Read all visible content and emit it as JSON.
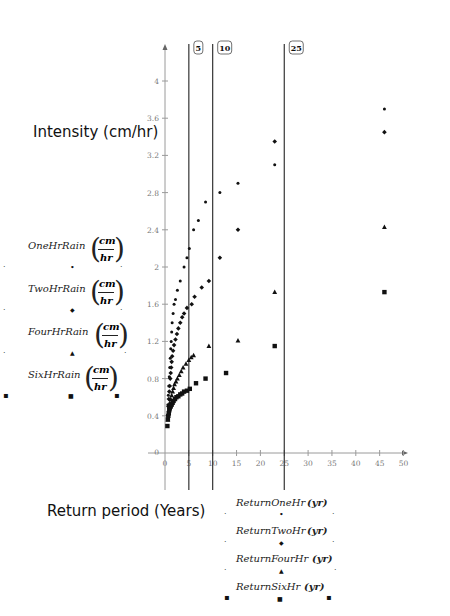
{
  "chart_data": {
    "type": "scatter",
    "title": "",
    "ylabel": "Intensity (cm/hr)",
    "xlabel": "Return period  (Years)",
    "xlim": [
      0,
      50
    ],
    "ylim": [
      0,
      4.2
    ],
    "x_ticks": [
      0,
      5,
      10,
      15,
      20,
      25,
      30,
      35,
      40,
      45,
      50
    ],
    "y_ticks": [
      0,
      0.4,
      0.8,
      1.2,
      1.6,
      2,
      2.4,
      2.8,
      3.2,
      3.6,
      4
    ],
    "y_tick_labels": [
      "0",
      "0.4",
      "0.8",
      "1.2",
      "1.6",
      "2",
      "2.4",
      "2.8",
      "3.2",
      "3.6",
      "4"
    ],
    "x_tick_labels": [
      "0",
      "5",
      "10",
      "15",
      "20",
      "25",
      "30",
      "35",
      "40",
      "45",
      "50"
    ],
    "grid": false,
    "vertical_markers": [
      {
        "x": 5,
        "label": "5"
      },
      {
        "x": 10,
        "label": "10"
      },
      {
        "x": 25,
        "label": "25"
      }
    ],
    "series": [
      {
        "name": "OneHrRain (cm/hr) vs ReturnOneHr (yr)",
        "y_name": "OneHrRain",
        "y_unit_num": "cm",
        "y_unit_den": "hr",
        "x_name": "ReturnOneHr",
        "x_unit": "yr",
        "marker": "dot",
        "points": [
          [
            0.6,
            0.52
          ],
          [
            0.7,
            0.62
          ],
          [
            0.8,
            0.72
          ],
          [
            0.9,
            0.82
          ],
          [
            1.0,
            0.92
          ],
          [
            1.1,
            1.02
          ],
          [
            1.2,
            1.12
          ],
          [
            1.3,
            1.2
          ],
          [
            1.4,
            1.3
          ],
          [
            1.5,
            1.4
          ],
          [
            1.7,
            1.5
          ],
          [
            1.9,
            1.6
          ],
          [
            2.2,
            1.65
          ],
          [
            2.6,
            1.75
          ],
          [
            3.2,
            1.85
          ],
          [
            4.0,
            2.0
          ],
          [
            4.6,
            2.1
          ],
          [
            5.1,
            2.2
          ],
          [
            6.0,
            2.4
          ],
          [
            7.0,
            2.5
          ],
          [
            8.5,
            2.7
          ],
          [
            11.5,
            2.8
          ],
          [
            15.3,
            2.9
          ],
          [
            23.0,
            3.1
          ],
          [
            46.0,
            3.7
          ]
        ]
      },
      {
        "name": "TwoHrRain (cm/hr) vs ReturnTwoHr (yr)",
        "y_name": "TwoHrRain",
        "y_unit_num": "cm",
        "y_unit_den": "hr",
        "x_name": "ReturnTwoHr",
        "x_unit": "yr",
        "marker": "diamond",
        "points": [
          [
            0.6,
            0.4
          ],
          [
            0.7,
            0.5
          ],
          [
            0.8,
            0.58
          ],
          [
            0.9,
            0.66
          ],
          [
            1.0,
            0.72
          ],
          [
            1.1,
            0.8
          ],
          [
            1.2,
            0.86
          ],
          [
            1.3,
            0.92
          ],
          [
            1.4,
            0.98
          ],
          [
            1.5,
            1.04
          ],
          [
            1.7,
            1.1
          ],
          [
            1.9,
            1.16
          ],
          [
            2.2,
            1.22
          ],
          [
            2.5,
            1.28
          ],
          [
            2.8,
            1.34
          ],
          [
            3.2,
            1.4
          ],
          [
            3.6,
            1.46
          ],
          [
            4.0,
            1.5
          ],
          [
            4.6,
            1.56
          ],
          [
            5.6,
            1.6
          ],
          [
            6.2,
            1.68
          ],
          [
            7.7,
            1.78
          ],
          [
            9.2,
            1.85
          ],
          [
            11.5,
            2.1
          ],
          [
            15.3,
            2.4
          ],
          [
            23.0,
            3.35
          ],
          [
            46.0,
            3.45
          ]
        ]
      },
      {
        "name": "FourHrRain (cm/hr) vs ReturnFourHr (yr)",
        "y_name": "FourHrRain",
        "y_unit_num": "cm",
        "y_unit_den": "hr",
        "x_name": "ReturnFourHr",
        "x_unit": "yr",
        "marker": "triangle",
        "points": [
          [
            0.6,
            0.36
          ],
          [
            0.7,
            0.42
          ],
          [
            0.8,
            0.46
          ],
          [
            0.9,
            0.5
          ],
          [
            1.0,
            0.54
          ],
          [
            1.2,
            0.58
          ],
          [
            1.4,
            0.62
          ],
          [
            1.6,
            0.66
          ],
          [
            1.8,
            0.7
          ],
          [
            2.0,
            0.74
          ],
          [
            2.3,
            0.77
          ],
          [
            2.6,
            0.8
          ],
          [
            3.0,
            0.84
          ],
          [
            3.4,
            0.88
          ],
          [
            3.8,
            0.92
          ],
          [
            4.4,
            0.96
          ],
          [
            5.0,
            1.0
          ],
          [
            5.5,
            1.03
          ],
          [
            6.0,
            1.05
          ],
          [
            9.2,
            1.15
          ],
          [
            15.3,
            1.21
          ],
          [
            23.0,
            1.73
          ],
          [
            46.0,
            2.43
          ]
        ]
      },
      {
        "name": "SixHrRain (cm/hr) vs ReturnSixHr (yr)",
        "y_name": "SixHrRain",
        "y_unit_num": "cm",
        "y_unit_den": "hr",
        "x_name": "ReturnSixHr",
        "x_unit": "yr",
        "marker": "square",
        "points": [
          [
            0.5,
            0.29
          ],
          [
            0.6,
            0.36
          ],
          [
            0.7,
            0.4
          ],
          [
            0.8,
            0.43
          ],
          [
            0.9,
            0.46
          ],
          [
            1.0,
            0.48
          ],
          [
            1.2,
            0.5
          ],
          [
            1.4,
            0.52
          ],
          [
            1.6,
            0.54
          ],
          [
            1.8,
            0.56
          ],
          [
            2.1,
            0.58
          ],
          [
            2.4,
            0.6
          ],
          [
            2.8,
            0.61
          ],
          [
            3.2,
            0.63
          ],
          [
            3.6,
            0.64
          ],
          [
            4.0,
            0.66
          ],
          [
            4.6,
            0.67
          ],
          [
            5.2,
            0.69
          ],
          [
            6.5,
            0.75
          ],
          [
            8.5,
            0.8
          ],
          [
            12.8,
            0.86
          ],
          [
            23.0,
            1.15
          ],
          [
            46.0,
            1.73
          ]
        ]
      }
    ]
  },
  "labels": {
    "ylabel": "Intensity (cm/hr)",
    "xlabel": "Return period  (Years)"
  },
  "legend_left": [
    {
      "name": "OneHrRain",
      "num": "cm",
      "den": "hr",
      "marker": "dot"
    },
    {
      "name": "TwoHrRain",
      "num": "cm",
      "den": "hr",
      "marker": "diamond"
    },
    {
      "name": "FourHrRain",
      "num": "cm",
      "den": "hr",
      "marker": "triangle"
    },
    {
      "name": "SixHrRain",
      "num": "cm",
      "den": "hr",
      "marker": "square"
    }
  ],
  "legend_bottom": [
    {
      "name": "ReturnOneHr",
      "unit": "(yr)",
      "marker": "dot"
    },
    {
      "name": "ReturnTwoHr",
      "unit": "(yr)",
      "marker": "diamond"
    },
    {
      "name": "ReturnFourHr",
      "unit": "(yr)",
      "marker": "triangle"
    },
    {
      "name": "ReturnSixHr",
      "unit": "(yr)",
      "marker": "square"
    }
  ],
  "glyphs": {
    "dot": "•",
    "diamond": "◆",
    "triangle": "▲",
    "square": "■",
    "paren_open": "(",
    "paren_close": ")"
  }
}
